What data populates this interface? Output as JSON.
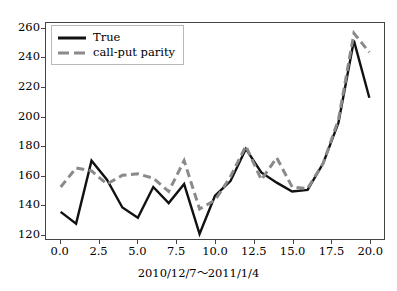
{
  "chart_data": {
    "type": "line",
    "title": "",
    "subtitle": "",
    "xlabel": "2010/12/7～2011/1/4",
    "ylabel": "",
    "xlim": [
      -0.95,
      20.95
    ],
    "ylim": [
      116.5,
      264.0
    ],
    "grid": false,
    "legend_position": "upper left",
    "xticks": [
      "0.0",
      "2.5",
      "5.0",
      "7.5",
      "10.0",
      "12.5",
      "15.0",
      "17.5",
      "20.0"
    ],
    "xtick_values": [
      0,
      2.5,
      5,
      7.5,
      10,
      12.5,
      15,
      17.5,
      20
    ],
    "yticks": [
      "120",
      "140",
      "160",
      "180",
      "200",
      "220",
      "240",
      "260"
    ],
    "ytick_values": [
      120,
      140,
      160,
      180,
      200,
      220,
      240,
      260
    ],
    "x": [
      0,
      1,
      2,
      3,
      4,
      5,
      6,
      7,
      8,
      9,
      10,
      11,
      12,
      13,
      14,
      15,
      16,
      17,
      18,
      19,
      20
    ],
    "series": [
      {
        "name": "True",
        "color": "#111111",
        "style": "solid",
        "width": 2.4,
        "values": [
          135,
          127,
          170,
          157,
          138,
          131,
          152,
          141,
          154,
          120,
          146,
          156,
          178,
          162,
          155,
          149,
          150,
          168,
          196,
          252,
          213
        ]
      },
      {
        "name": "call-put parity",
        "color": "#8a8a8a",
        "style": "dashed",
        "width": 3.0,
        "values": [
          152,
          165,
          163,
          154,
          160,
          161,
          158,
          149,
          170,
          137,
          143,
          159,
          180,
          157,
          172,
          152,
          151,
          168,
          198,
          257,
          244
        ]
      }
    ]
  },
  "legend": {
    "items": [
      {
        "label": "True",
        "swatch": "solid-line-swatch"
      },
      {
        "label": "call-put parity",
        "swatch": "dashed-line-swatch"
      }
    ]
  },
  "colors": {
    "true_series": "#111111",
    "parity_series": "#8a8a8a",
    "axis": "#444444",
    "background": "#ffffff"
  }
}
